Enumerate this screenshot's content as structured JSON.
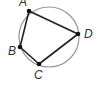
{
  "figure": {
    "type": "cyclic-quadrilateral",
    "circle": {
      "cx": 49,
      "cy": 37,
      "r": 30,
      "stroke": "#999999"
    },
    "polygon_stroke": "#222222",
    "points": [
      {
        "label": "A",
        "x": 29,
        "y": 11,
        "lx": 19,
        "ly": 6
      },
      {
        "label": "D",
        "x": 78,
        "y": 34,
        "lx": 84,
        "ly": 38
      },
      {
        "label": "C",
        "x": 39,
        "y": 64,
        "lx": 34,
        "ly": 79
      },
      {
        "label": "B",
        "x": 20,
        "y": 47,
        "lx": 8,
        "ly": 55
      }
    ]
  }
}
